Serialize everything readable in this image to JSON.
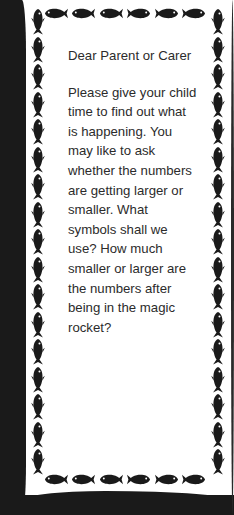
{
  "letter": {
    "greeting": "Dear Parent or Carer",
    "body": "Please give your child time to find out what is happening. You may like to ask whether the numbers are getting larger or smaller. What symbols shall we use? How much smaller or larger are the numbers after being in the magic rocket?"
  },
  "border": {
    "icon": "fish-icon",
    "top_row_count": 6,
    "bottom_row_count": 6,
    "side_column_count": 17,
    "color": "#1a1a1a"
  }
}
